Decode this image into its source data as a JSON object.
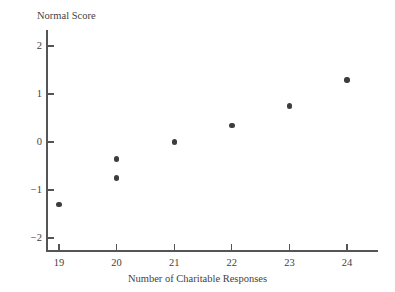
{
  "chart_data": {
    "type": "scatter",
    "title": "",
    "xlabel": "Number of Charitable Responses",
    "ylabel": "Normal Score",
    "xlim": [
      18.6,
      24.6
    ],
    "ylim": [
      -2.3,
      2.3
    ],
    "grid": false,
    "legend": null,
    "x_ticks": [
      19,
      20,
      21,
      22,
      23,
      24
    ],
    "x_tick_labels": [
      "19",
      "20",
      "21",
      "22",
      "23",
      "24"
    ],
    "y_ticks": [
      2,
      1,
      0,
      -1,
      -2
    ],
    "y_tick_labels": [
      "2",
      "1",
      "0",
      "−1",
      "−2"
    ],
    "x": [
      19,
      20,
      20,
      21,
      22,
      23,
      24
    ],
    "y": [
      -1.3,
      -0.75,
      -0.35,
      0.0,
      0.35,
      0.75,
      1.29
    ],
    "points": [
      {
        "x": 19,
        "y": -1.3
      },
      {
        "x": 20,
        "y": -0.75
      },
      {
        "x": 20,
        "y": -0.35
      },
      {
        "x": 21,
        "y": 0.0
      },
      {
        "x": 22,
        "y": 0.35
      },
      {
        "x": 23,
        "y": 0.75
      },
      {
        "x": 24,
        "y": 1.29
      }
    ],
    "marker": "filled-circle",
    "marker_color": "#3d3d3d",
    "axis_color": "#555555",
    "background_color": "#ffffff"
  },
  "axes": {
    "y_title": "Normal Score",
    "x_title": "Number of Charitable Responses"
  }
}
